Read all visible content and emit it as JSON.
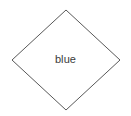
{
  "canvas": {
    "width": 131,
    "height": 116,
    "background_color": "#ffffff"
  },
  "diagram": {
    "type": "shape-diagram",
    "shapes": [
      {
        "name": "diamond",
        "shape_type": "rhombus",
        "label": "blue",
        "stroke_color": "#595959",
        "stroke_width": 1,
        "fill_color": "#ffffff",
        "vertices": {
          "top": [
            66,
            10
          ],
          "right": [
            120,
            60
          ],
          "bottom": [
            66,
            110
          ],
          "left": [
            12,
            60
          ]
        },
        "points": "66,10 120,60 66,110 12,60",
        "label_color": "#3b3b3b",
        "label_font_size": 11
      }
    ]
  }
}
